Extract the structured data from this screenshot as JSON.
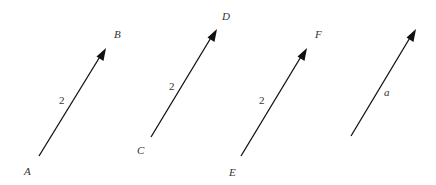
{
  "diagram": {
    "colors": {
      "line": "#111111",
      "text": "#333333",
      "background": "#ffffff"
    },
    "vectors": [
      {
        "id": "AB",
        "start_label": "A",
        "end_label": "B",
        "magnitude_label": "2"
      },
      {
        "id": "CD",
        "start_label": "C",
        "end_label": "D",
        "magnitude_label": "2"
      },
      {
        "id": "EF",
        "start_label": "E",
        "end_label": "F",
        "magnitude_label": "2"
      },
      {
        "id": "a",
        "start_label": "",
        "end_label": "",
        "magnitude_label": "a"
      }
    ]
  }
}
